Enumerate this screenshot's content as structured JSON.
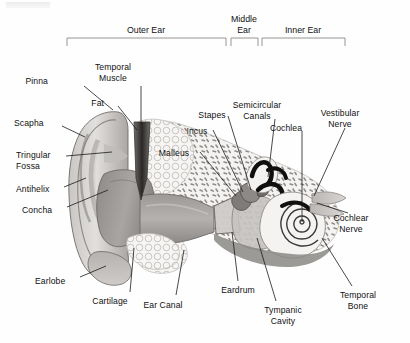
{
  "diagram": {
    "style": "grayscale cross-section illustration with leader lines",
    "sections": [
      {
        "name": "outer-ear",
        "label": "Outer Ear",
        "bracket": {
          "x1": 67,
          "x2": 226,
          "y": 38,
          "tick": 8
        },
        "label_x": 146,
        "label_y": 25
      },
      {
        "name": "middle-ear",
        "label": "Middle\nEar",
        "bracket": {
          "x1": 231,
          "x2": 258,
          "y": 38,
          "tick": 8
        },
        "label_x": 244,
        "label_y": 14
      },
      {
        "name": "inner-ear",
        "label": "Inner Ear",
        "bracket": {
          "x1": 262,
          "x2": 345,
          "y": 38,
          "tick": 8
        },
        "label_x": 303,
        "label_y": 25
      }
    ],
    "labels": [
      {
        "name": "pinna",
        "text": "Pinna",
        "x": 48,
        "y": 76,
        "align": "r",
        "leader": [
          [
            84,
            86
          ],
          [
            113,
            110
          ]
        ]
      },
      {
        "name": "temporal-muscle",
        "text": "Temporal\nMuscle",
        "x": 113,
        "y": 62,
        "align": "c",
        "leader": [
          [
            141,
            86
          ],
          [
            141,
            124
          ]
        ]
      },
      {
        "name": "fat",
        "text": "Fat",
        "x": 104,
        "y": 98,
        "align": "r",
        "leader": [
          [
            118,
            106
          ],
          [
            137,
            130
          ]
        ]
      },
      {
        "name": "scapha",
        "text": "Scapha",
        "x": 14,
        "y": 118,
        "align": "l",
        "leader": [
          [
            62,
            126
          ],
          [
            85,
            137
          ]
        ]
      },
      {
        "name": "tringular-fossa",
        "text": "Tringular\nFossa",
        "x": 16,
        "y": 150,
        "align": "l",
        "leader": [
          [
            66,
            156
          ],
          [
            112,
            152
          ]
        ]
      },
      {
        "name": "antihelix",
        "text": "Antihelix",
        "x": 16,
        "y": 184,
        "align": "l",
        "leader": [
          [
            64,
            187
          ],
          [
            86,
            178
          ]
        ]
      },
      {
        "name": "concha",
        "text": "Concha",
        "x": 22,
        "y": 205,
        "align": "l",
        "leader": [
          [
            67,
            207
          ],
          [
            108,
            190
          ]
        ]
      },
      {
        "name": "earlobe",
        "text": "Earlobe",
        "x": 35,
        "y": 276,
        "align": "l",
        "leader": [
          [
            80,
            277
          ],
          [
            106,
            266
          ]
        ]
      },
      {
        "name": "cartilage",
        "text": "Cartilage",
        "x": 110,
        "y": 296,
        "align": "c",
        "leader": [
          [
            130,
            292
          ],
          [
            134,
            248
          ]
        ]
      },
      {
        "name": "ear-canal",
        "text": "Ear Canal",
        "x": 163,
        "y": 300,
        "align": "c",
        "leader": [
          [
            176,
            295
          ],
          [
            184,
            250
          ]
        ]
      },
      {
        "name": "malleus",
        "text": "Malleus",
        "x": 174,
        "y": 148,
        "align": "c",
        "leader": [
          [
            200,
            152
          ],
          [
            236,
            196
          ]
        ]
      },
      {
        "name": "incus",
        "text": "Incus",
        "x": 197,
        "y": 126,
        "align": "c",
        "leader": [
          [
            213,
            130
          ],
          [
            243,
            192
          ]
        ]
      },
      {
        "name": "stapes",
        "text": "Stapes",
        "x": 212,
        "y": 110,
        "align": "c",
        "leader": [
          [
            228,
            116
          ],
          [
            251,
            190
          ]
        ]
      },
      {
        "name": "semicircular-canals",
        "text": "Semicircular\nCanals",
        "x": 257,
        "y": 100,
        "align": "c",
        "leader": [
          [
            275,
            119
          ],
          [
            268,
            177
          ]
        ]
      },
      {
        "name": "cochlea",
        "text": "Cochlea",
        "x": 286,
        "y": 123,
        "align": "c",
        "leader": [
          [
            302,
            131
          ],
          [
            302,
            222
          ]
        ]
      },
      {
        "name": "vestibular-nerve",
        "text": "Vestibular\nNerve",
        "x": 340,
        "y": 108,
        "align": "c",
        "leader": [
          [
            345,
            128
          ],
          [
            314,
            196
          ]
        ]
      },
      {
        "name": "cochlear-nerve",
        "text": "Cochlear\nNerve",
        "x": 351,
        "y": 213,
        "align": "c",
        "leader": [
          [
            348,
            213
          ],
          [
            317,
            203
          ]
        ]
      },
      {
        "name": "eardrum",
        "text": "Eardrum",
        "x": 238,
        "y": 285,
        "align": "c",
        "leader": [
          [
            238,
            281
          ],
          [
            232,
            232
          ]
        ]
      },
      {
        "name": "tympanic-cavity",
        "text": "Tympanic\nCavity",
        "x": 283,
        "y": 305,
        "align": "c",
        "leader": [
          [
            276,
            301
          ],
          [
            257,
            238
          ]
        ]
      },
      {
        "name": "temporal-bone",
        "text": "Temporal\nBone",
        "x": 358,
        "y": 290,
        "align": "c",
        "leader": [
          [
            352,
            286
          ],
          [
            322,
            238
          ]
        ]
      }
    ],
    "palette": {
      "ink": "#111111",
      "leader": "#1a1a1a",
      "skin_light": "#d8d6d4",
      "skin_mid": "#b9b6b4",
      "skin_dark": "#96928f",
      "canal_dark": "#8d8a87",
      "bone_light": "#f2f1ef",
      "bone_speck": "#9b9896",
      "muscle_dark": "#4a4846",
      "cochlea_black": "#101010",
      "background": "#ffffff"
    }
  }
}
